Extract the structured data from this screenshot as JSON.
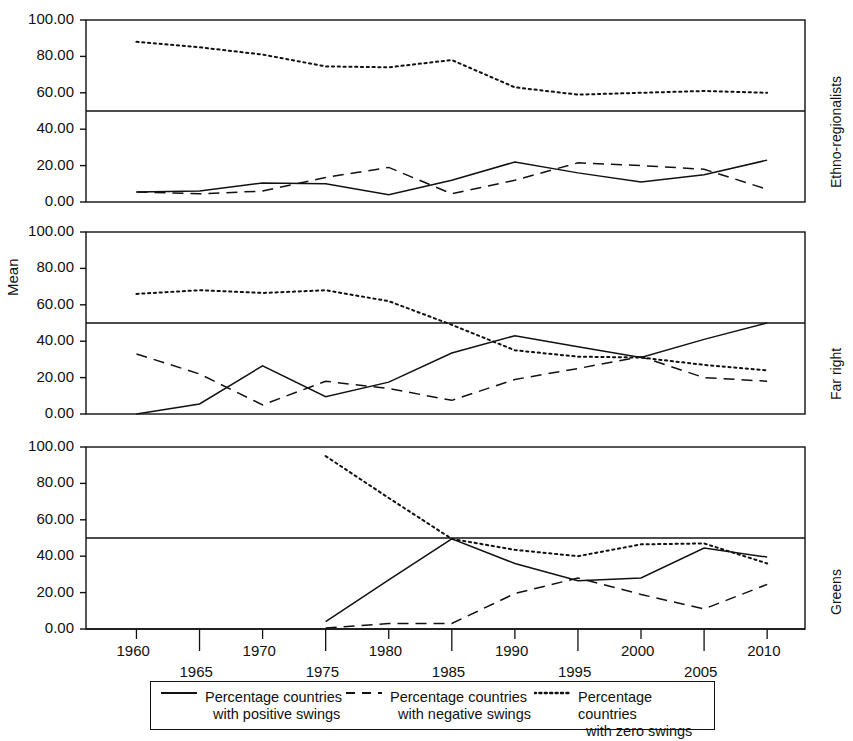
{
  "axis": {
    "ylabel": "Mean",
    "yticks": [
      "100.00",
      "80.00",
      "60.00",
      "40.00",
      "20.00",
      "0.00"
    ],
    "yvalues": [
      100,
      80,
      60,
      40,
      20,
      0
    ],
    "xticks": [
      "1960",
      "1965",
      "1970",
      "1975",
      "1980",
      "1985",
      "1990",
      "1995",
      "2000",
      "2005",
      "2010"
    ],
    "xvalues": [
      1960,
      1965,
      1970,
      1975,
      1980,
      1985,
      1990,
      1995,
      2000,
      2005,
      2010
    ],
    "xlim": [
      1956,
      2013
    ],
    "ylim": [
      0,
      100
    ],
    "reference_line": 50
  },
  "panels": [
    {
      "label": "Ethno-regionalists"
    },
    {
      "label": "Far right"
    },
    {
      "label": "Greens"
    }
  ],
  "legend": {
    "items": [
      {
        "style": "solid",
        "line1": "Percentage countries",
        "line2": "with positive swings"
      },
      {
        "style": "dashed",
        "line1": "Percentage countries",
        "line2": "with negative swings"
      },
      {
        "style": "dotted",
        "line1": "Percentage countries",
        "line2": "with zero swings"
      }
    ]
  },
  "chart_data": {
    "type": "line",
    "title": "",
    "xlabel": "",
    "ylabel": "Mean",
    "xlim": [
      1956,
      2013
    ],
    "ylim": [
      0,
      100
    ],
    "grid": false,
    "legend_position": "bottom",
    "reference_line_y": 50,
    "panel_layout": "3 stacked panels sharing one x axis; panel labels on right side",
    "panels": [
      {
        "name": "Ethno-regionalists",
        "x": [
          1960,
          1965,
          1970,
          1975,
          1980,
          1985,
          1990,
          1995,
          2000,
          2005,
          2010
        ],
        "series": [
          {
            "name": "Percentage countries with positive swings",
            "style": "solid",
            "values": [
              5.5,
              6.0,
              10.5,
              10.0,
              4.0,
              12.0,
              22.0,
              16.0,
              11.0,
              15.0,
              23.0
            ]
          },
          {
            "name": "Percentage countries with negative swings",
            "style": "dashed",
            "values": [
              5.5,
              4.5,
              6.0,
              13.5,
              19.0,
              4.5,
              12.0,
              21.5,
              20.0,
              18.0,
              7.0
            ]
          },
          {
            "name": "Percentage countries with zero swings",
            "style": "dotted",
            "values": [
              88.0,
              85.0,
              81.0,
              74.5,
              74.0,
              78.0,
              63.0,
              59.0,
              60.0,
              61.0,
              60.0
            ]
          }
        ]
      },
      {
        "name": "Far right",
        "x": [
          1960,
          1965,
          1970,
          1975,
          1980,
          1985,
          1990,
          1995,
          2000,
          2005,
          2010
        ],
        "series": [
          {
            "name": "Percentage countries with positive swings",
            "style": "solid",
            "values": [
              0.0,
              5.5,
              26.5,
              9.5,
              17.5,
              33.5,
              43.0,
              37.0,
              31.0,
              41.0,
              50.0
            ]
          },
          {
            "name": "Percentage countries with negative swings",
            "style": "dashed",
            "values": [
              33.0,
              22.0,
              5.0,
              18.0,
              14.0,
              7.5,
              19.0,
              25.0,
              31.5,
              20.0,
              18.0
            ]
          },
          {
            "name": "Percentage countries with zero swings",
            "style": "dotted",
            "values": [
              66.0,
              68.0,
              66.5,
              68.0,
              62.0,
              49.0,
              35.0,
              31.5,
              31.0,
              27.0,
              24.0
            ]
          }
        ]
      },
      {
        "name": "Greens",
        "x": [
          1975,
          1980,
          1985,
          1990,
          1995,
          2000,
          2005,
          2010
        ],
        "series": [
          {
            "name": "Percentage countries with positive swings",
            "style": "solid",
            "values": [
              4.0,
              27.0,
              49.5,
              36.0,
              26.5,
              28.0,
              44.5,
              39.5
            ]
          },
          {
            "name": "Percentage countries with negative swings",
            "style": "dashed",
            "values": [
              0.5,
              3.0,
              3.0,
              19.5,
              28.0,
              19.0,
              11.0,
              24.5
            ]
          },
          {
            "name": "Percentage countries with zero swings",
            "style": "dotted",
            "values": [
              95.0,
              72.0,
              49.5,
              43.5,
              40.0,
              46.5,
              47.0,
              36.0
            ]
          }
        ]
      }
    ]
  }
}
